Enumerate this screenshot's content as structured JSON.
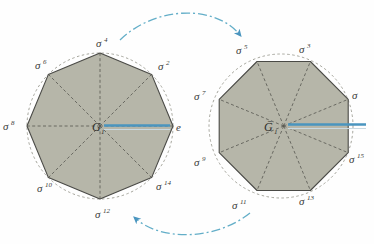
{
  "figure": {
    "background_color": "#ffffff",
    "polygon_fill": "#b6b6a9",
    "polygon_stroke": "#4a4a46",
    "dashed_circle_color": "#8a8a82",
    "spoke_color": "#55554f",
    "arrow_color": "#63aec8",
    "marker_color": "#4a95bf",
    "label_color": "#3a3a38"
  },
  "left_polygon": {
    "name": "left-octagon",
    "center_label": "G",
    "center_subscript": "1",
    "marker_label": "e",
    "vertex_labels": [
      {
        "sigma": "σ",
        "exponent": "4",
        "pos": "top"
      },
      {
        "sigma": "σ",
        "exponent": "2",
        "pos": "top-right"
      },
      {
        "sigma": "σ",
        "exponent": "",
        "pos": "right"
      },
      {
        "sigma": "σ",
        "exponent": "14",
        "pos": "bottom-right"
      },
      {
        "sigma": "σ",
        "exponent": "12",
        "pos": "bottom"
      },
      {
        "sigma": "σ",
        "exponent": "10",
        "pos": "bottom-left"
      },
      {
        "sigma": "σ",
        "exponent": "8",
        "pos": "left"
      },
      {
        "sigma": "σ",
        "exponent": "6",
        "pos": "top-left"
      }
    ],
    "visible_labels": [
      "σ4",
      "σ2",
      "σ14",
      "σ12",
      "σ10",
      "σ8",
      "σ6",
      "e"
    ]
  },
  "right_polygon": {
    "name": "right-octagon",
    "center_label": "Ḡ",
    "center_subscript": "1",
    "vertex_labels": [
      {
        "sigma": "σ",
        "exponent": "3",
        "pos": "top-right"
      },
      {
        "sigma": "σ",
        "exponent": "",
        "pos": "right"
      },
      {
        "sigma": "σ",
        "exponent": "15",
        "pos": "bottom-right"
      },
      {
        "sigma": "σ",
        "exponent": "13",
        "pos": "bottom"
      },
      {
        "sigma": "σ",
        "exponent": "11",
        "pos": "bottom-left"
      },
      {
        "sigma": "σ",
        "exponent": "9",
        "pos": "left"
      },
      {
        "sigma": "σ",
        "exponent": "7",
        "pos": "top-left"
      },
      {
        "sigma": "σ",
        "exponent": "5",
        "pos": "top"
      }
    ],
    "visible_labels": [
      "σ5",
      "σ3",
      "σ",
      "σ15",
      "σ13",
      "σ11",
      "σ9",
      "σ7"
    ]
  },
  "arrows": {
    "top": {
      "name": "top-curved-arrow",
      "direction": "left-to-right",
      "style": "dash-dot",
      "color": "#63aec8"
    },
    "bottom": {
      "name": "bottom-curved-arrow",
      "direction": "right-to-left",
      "style": "dash-dot",
      "color": "#63aec8"
    }
  },
  "labels": {
    "sigma4": "σ",
    "sigma4_sup": "4",
    "sigma2": "σ",
    "sigma2_sup": "2",
    "sigma14": "σ",
    "sigma14_sup": "14",
    "sigma12": "σ",
    "sigma12_sup": "12",
    "sigma10": "σ",
    "sigma10_sup": "10",
    "sigma8": "σ",
    "sigma8_sup": "8",
    "sigma6": "σ",
    "sigma6_sup": "6",
    "e": "e",
    "G1": "G",
    "G1_sub": "1",
    "Gbar1": "Ḡ",
    "Gbar1_sub": "1",
    "sigma5": "σ",
    "sigma5_sup": "5",
    "sigma3": "σ",
    "sigma3_sup": "3",
    "sigma1": "σ",
    "sigma1_sup": "",
    "sigma15": "σ",
    "sigma15_sup": "15",
    "sigma13": "σ",
    "sigma13_sup": "13",
    "sigma11": "σ",
    "sigma11_sup": "11",
    "sigma9": "σ",
    "sigma9_sup": "9",
    "sigma7": "σ",
    "sigma7_sup": "7"
  }
}
